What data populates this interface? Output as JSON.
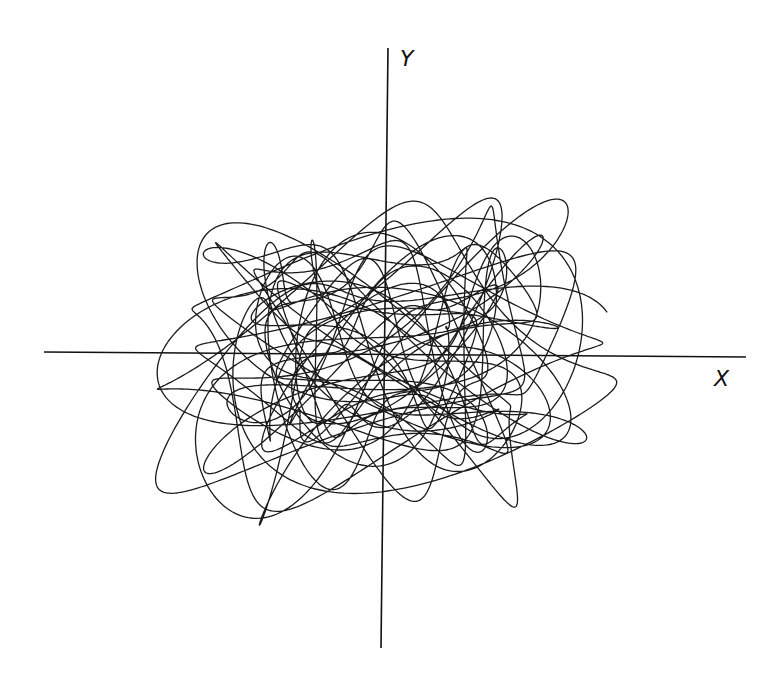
{
  "chart_data": {
    "type": "line",
    "title": "",
    "xlabel": "X",
    "ylabel": "Y",
    "grid": false,
    "legend": null,
    "axes": {
      "origin_px": [
        384,
        354
      ],
      "x_axis_px": {
        "from": [
          44,
          352
        ],
        "to": [
          746,
          357
        ]
      },
      "y_axis_px": {
        "from": [
          388,
          48
        ],
        "to": [
          381,
          648
        ]
      }
    },
    "extent_px": {
      "xmin": 100,
      "xmax": 680,
      "ymin": 138,
      "ymax": 570
    },
    "xlim": [
      -1,
      1
    ],
    "ylim": [
      -1,
      1
    ],
    "trajectory_params": {
      "ax": 0.88,
      "ay": 0.82,
      "fx": [
        1.0,
        2.31,
        0.47
      ],
      "fy": [
        1.13,
        2.71,
        0.59
      ],
      "wx": [
        0.72,
        0.18,
        0.1
      ],
      "wy": [
        0.62,
        0.22,
        0.16
      ],
      "t_max": 180,
      "steps": 9000
    },
    "stroke_color": "#1a1a1a"
  }
}
